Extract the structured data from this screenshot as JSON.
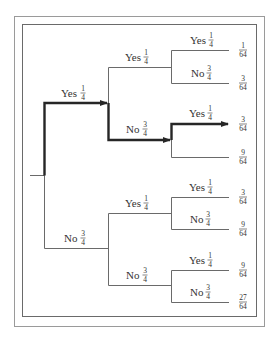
{
  "colors": {
    "thin_line": "#6a6a6a",
    "thick_line": "#262626",
    "text": "#333333"
  },
  "level1": [
    {
      "label": "Yes",
      "num": "1",
      "den": "4"
    },
    {
      "label": "No",
      "num": "3",
      "den": "4"
    }
  ],
  "level2": [
    {
      "label": "Yes",
      "num": "1",
      "den": "4"
    },
    {
      "label": "No",
      "num": "3",
      "den": "4"
    },
    {
      "label": "Yes",
      "num": "1",
      "den": "4"
    },
    {
      "label": "No",
      "num": "3",
      "den": "4"
    }
  ],
  "level3": [
    {
      "label": "Yes",
      "num": "1",
      "den": "4"
    },
    {
      "label": "No",
      "num": "3",
      "den": "4"
    },
    {
      "label": "Yes",
      "num": "1",
      "den": "4"
    },
    {
      "label": "No",
      "num": "3",
      "den": "4"
    },
    {
      "label": "Yes",
      "num": "1",
      "den": "4"
    },
    {
      "label": "No",
      "num": "3",
      "den": "4"
    },
    {
      "label": "Yes",
      "num": "1",
      "den": "4"
    },
    {
      "label": "No",
      "num": "3",
      "den": "4"
    }
  ],
  "leaves": [
    {
      "num": "1",
      "den": "64"
    },
    {
      "num": "3",
      "den": "64"
    },
    {
      "num": "3",
      "den": "64"
    },
    {
      "num": "9",
      "den": "64"
    },
    {
      "num": "3",
      "den": "64"
    },
    {
      "num": "9",
      "den": "64"
    },
    {
      "num": "9",
      "den": "64"
    },
    {
      "num": "27",
      "den": "64"
    }
  ],
  "highlighted_path": "Yes 1/4 → No 3/4 → Yes 1/4 = 3/64"
}
